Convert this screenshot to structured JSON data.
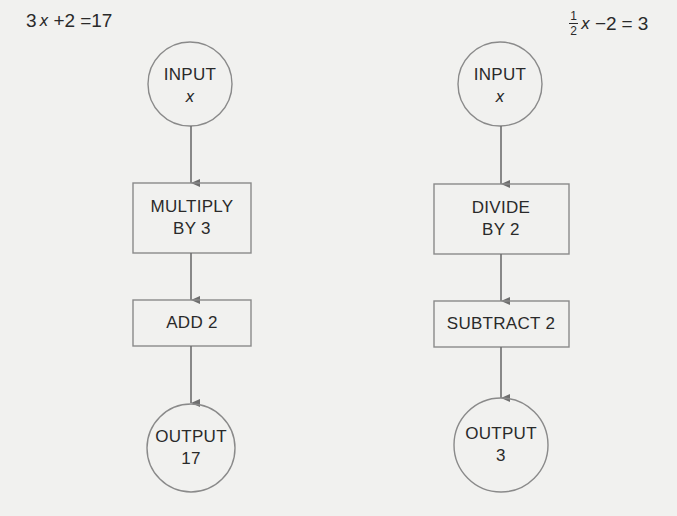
{
  "left_flow": {
    "equation": {
      "coef": "3",
      "var": "x",
      "op": "+2",
      "eq": "=",
      "rhs": "17"
    },
    "input": {
      "title": "INPUT",
      "value": "x"
    },
    "steps": [
      {
        "line1": "MULTIPLY",
        "line2": "BY 3"
      },
      {
        "line1": "ADD 2",
        "line2": ""
      }
    ],
    "output": {
      "title": "OUTPUT",
      "value": "17"
    }
  },
  "right_flow": {
    "equation": {
      "frac_num": "1",
      "frac_den": "2",
      "var": "x",
      "op": "−2",
      "eq": "=",
      "rhs": "3"
    },
    "input": {
      "title": "INPUT",
      "value": "x"
    },
    "steps": [
      {
        "line1": "DIVIDE",
        "line2": "BY 2"
      },
      {
        "line1": "SUBTRACT 2",
        "line2": ""
      }
    ],
    "output": {
      "title": "OUTPUT",
      "value": "3"
    }
  },
  "colors": {
    "stroke": "#7a7a7a",
    "text": "#2a2a2a",
    "background": "#f1f1ef"
  }
}
